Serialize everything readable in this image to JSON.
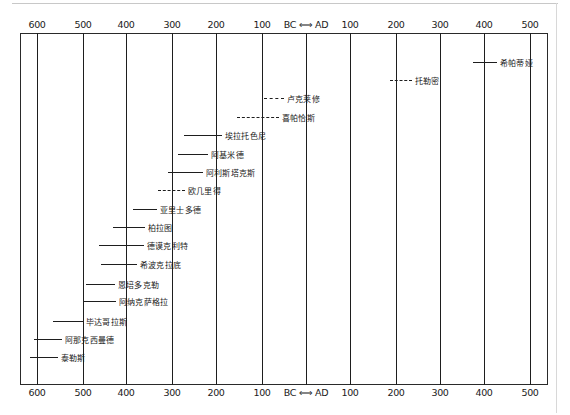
{
  "axis": {
    "bc_label": "BC",
    "ad_label": "AD",
    "divider_glyph": "⟺",
    "ticks": [
      {
        "label": "600",
        "era": "BC",
        "x": 37
      },
      {
        "label": "500",
        "era": "BC",
        "x": 83
      },
      {
        "label": "400",
        "era": "BC",
        "x": 126
      },
      {
        "label": "300",
        "era": "BC",
        "x": 172
      },
      {
        "label": "200",
        "era": "BC",
        "x": 216
      },
      {
        "label": "100",
        "era": "BC",
        "x": 262
      },
      {
        "label": "BC ⟺ AD",
        "era": "0",
        "x": 306
      },
      {
        "label": "100",
        "era": "AD",
        "x": 350
      },
      {
        "label": "200",
        "era": "AD",
        "x": 396
      },
      {
        "label": "300",
        "era": "AD",
        "x": 440
      },
      {
        "label": "400",
        "era": "AD",
        "x": 484
      },
      {
        "label": "500",
        "era": "AD",
        "x": 530
      }
    ]
  },
  "entries": [
    {
      "name": "希帕蒂娅",
      "x1": 473,
      "x2": 497,
      "y": 62,
      "style": "solid"
    },
    {
      "name": "托勒密",
      "x1": 390,
      "x2": 412,
      "y": 80,
      "style": "dashed"
    },
    {
      "name": "卢克莱修",
      "x1": 264,
      "x2": 284,
      "y": 98,
      "style": "dashed"
    },
    {
      "name": "喜帕恰斯",
      "x1": 237,
      "x2": 279,
      "y": 117,
      "style": "dashed"
    },
    {
      "name": "埃拉托色尼",
      "x1": 184,
      "x2": 222,
      "y": 135,
      "style": "solid"
    },
    {
      "name": "阿基米德",
      "x1": 178,
      "x2": 208,
      "y": 154,
      "style": "solid"
    },
    {
      "name": "阿利斯塔克斯",
      "x1": 168,
      "x2": 203,
      "y": 172,
      "style": "solid"
    },
    {
      "name": "欧几里得",
      "x1": 158,
      "x2": 185,
      "y": 190,
      "style": "dashed"
    },
    {
      "name": "亚里士多德",
      "x1": 133,
      "x2": 157,
      "y": 209,
      "style": "solid"
    },
    {
      "name": "柏拉图",
      "x1": 113,
      "x2": 145,
      "y": 227,
      "style": "solid"
    },
    {
      "name": "德谟克利特",
      "x1": 99,
      "x2": 144,
      "y": 245,
      "style": "solid"
    },
    {
      "name": "希波克拉底",
      "x1": 101,
      "x2": 137,
      "y": 264,
      "style": "solid"
    },
    {
      "name": "恩培多克勒",
      "x1": 86,
      "x2": 115,
      "y": 284,
      "style": "solid"
    },
    {
      "name": "阿纳克萨格拉",
      "x1": 83,
      "x2": 116,
      "y": 301,
      "style": "solid"
    },
    {
      "name": "毕达哥拉斯",
      "x1": 53,
      "x2": 83,
      "y": 321,
      "style": "solid"
    },
    {
      "name": "阿那克西曼德",
      "x1": 34,
      "x2": 62,
      "y": 339,
      "style": "solid"
    },
    {
      "name": "泰勒斯",
      "x1": 30,
      "x2": 58,
      "y": 357,
      "style": "solid"
    }
  ]
}
